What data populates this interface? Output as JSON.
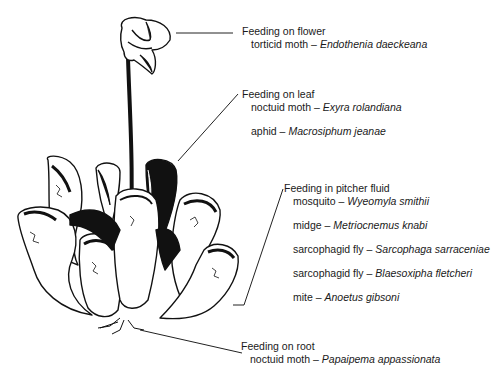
{
  "figure": {
    "groups": [
      {
        "heading": "Feeding on flower",
        "entries": [
          {
            "common": "torticid moth",
            "dash": " – ",
            "species": "Endothenia daeckeana"
          }
        ]
      },
      {
        "heading": "Feeding on leaf",
        "entries": [
          {
            "common": "noctuid moth",
            "dash": " – ",
            "species": "Exyra rolandiana"
          },
          {
            "common": "aphid",
            "dash": " – ",
            "species": "Macrosiphum jeanae"
          }
        ]
      },
      {
        "heading": "Feeding in pitcher fluid",
        "entries": [
          {
            "common": "mosquito",
            "dash": " – ",
            "species": "Wyeomyla smithii"
          },
          {
            "common": "midge",
            "dash": " – ",
            "species": "Metriocnemus knabi"
          },
          {
            "common": "sarcophagid fly",
            "dash": " – ",
            "species": "Sarcophaga sarraceniae"
          },
          {
            "common": "sarcophagid fly",
            "dash": " – ",
            "species": "Blaesoxipha fletcheri"
          },
          {
            "common": "mite",
            "dash": " – ",
            "species": "Anoetus gibsoni"
          }
        ]
      },
      {
        "heading": "Feeding on root",
        "entries": [
          {
            "common": "noctuid moth",
            "dash": " – ",
            "species": "Papaipema appassionata"
          }
        ]
      }
    ]
  },
  "colors": {
    "ink": "#1a1a1a",
    "background": "#ffffff"
  }
}
